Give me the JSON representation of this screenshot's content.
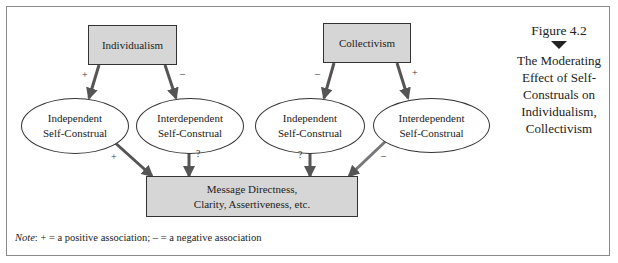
{
  "figure": {
    "number": "Figure 4.2",
    "title_lines": [
      "The Moderating",
      "Effect of Self-",
      "Construals on",
      "Individualism,",
      "Collectivism"
    ]
  },
  "nodes": {
    "individualism": {
      "label": "Individualism"
    },
    "collectivism": {
      "label": "Collectivism"
    },
    "ind_independent": {
      "line1": "Independent",
      "line2": "Self-Construal"
    },
    "ind_interdependent": {
      "line1": "Interdependent",
      "line2": "Self-Construal"
    },
    "col_independent": {
      "line1": "Independent",
      "line2": "Self-Construal"
    },
    "col_interdependent": {
      "line1": "Interdependent",
      "line2": "Self-Construal"
    },
    "outcome": {
      "line1": "Message Directness,",
      "line2": "Clarity, Assertiveness, etc."
    }
  },
  "edges": [
    {
      "from": "Individualism",
      "to": "Independent Self-Construal (left)",
      "sign": "+"
    },
    {
      "from": "Individualism",
      "to": "Interdependent Self-Construal (left)",
      "sign": "–"
    },
    {
      "from": "Collectivism",
      "to": "Independent Self-Construal (right)",
      "sign": "–"
    },
    {
      "from": "Collectivism",
      "to": "Interdependent Self-Construal (right)",
      "sign": "+"
    },
    {
      "from": "Independent Self-Construal (left)",
      "to": "Message Directness",
      "sign": "+"
    },
    {
      "from": "Interdependent Self-Construal (left)",
      "to": "Message Directness",
      "sign": "?"
    },
    {
      "from": "Independent Self-Construal (right)",
      "to": "Message Directness",
      "sign": "?"
    },
    {
      "from": "Interdependent Self-Construal (right)",
      "to": "Message Directness",
      "sign": "–"
    }
  ],
  "note": {
    "label": "Note",
    "text": ": + = a positive association; – = a negative association"
  },
  "colors": {
    "box_fill": "#d6d6d6",
    "arrow": "#555555",
    "frame": "#8a8a8a"
  }
}
